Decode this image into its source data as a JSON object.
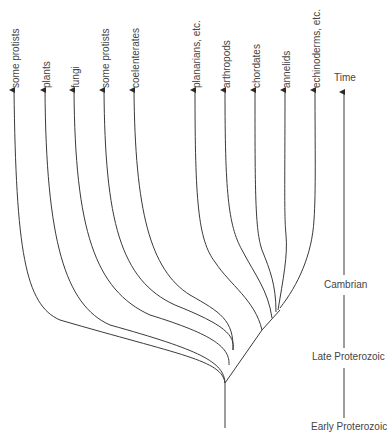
{
  "diagram": {
    "type": "phylogenetic-tree",
    "line_color": "#3a3a3a",
    "taxa": [
      {
        "label": "some protists",
        "x": 14
      },
      {
        "label": "plants",
        "x": 45
      },
      {
        "label": "fungi",
        "x": 74
      },
      {
        "label": "some protists",
        "x": 104
      },
      {
        "label": "coelenterates",
        "x": 134
      },
      {
        "label": "planarians, etc.",
        "x": 195
      },
      {
        "label": "arthropods",
        "x": 225
      },
      {
        "label": "chordates",
        "x": 255
      },
      {
        "label": "annelids",
        "x": 285
      },
      {
        "label": "echinoderms, etc.",
        "x": 315
      }
    ],
    "time_axis": {
      "label": "Time",
      "eras": [
        {
          "label": "Cambrian"
        },
        {
          "label": "Late Proterozoic"
        },
        {
          "label": "Early Proterozoic"
        }
      ]
    }
  }
}
